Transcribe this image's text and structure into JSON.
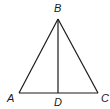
{
  "diagram": {
    "type": "geometry-triangle",
    "stroke_color": "#1a1a1a",
    "background": "#ffffff",
    "points": {
      "A": {
        "label": "A",
        "x": 19,
        "y": 93,
        "label_x": 8,
        "label_y": 102
      },
      "B": {
        "label": "B",
        "x": 58,
        "y": 19,
        "label_x": 54,
        "label_y": 12
      },
      "C": {
        "label": "C",
        "x": 98,
        "y": 93,
        "label_x": 101,
        "label_y": 102
      },
      "D": {
        "label": "D",
        "x": 58,
        "y": 93,
        "label_x": 54,
        "label_y": 106
      }
    },
    "segments": [
      {
        "from": "A",
        "to": "B"
      },
      {
        "from": "B",
        "to": "C"
      },
      {
        "from": "A",
        "to": "C"
      },
      {
        "from": "B",
        "to": "D"
      }
    ]
  }
}
